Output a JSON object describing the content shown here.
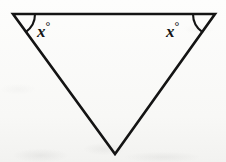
{
  "figure": {
    "background_color": "#fbfbfa",
    "stroke_color": "#141414",
    "stroke_width": 2.6,
    "shape": {
      "name": "triangle",
      "orientation": "point-down",
      "vertices": [
        {
          "name": "top-left",
          "x": 13,
          "y": 14
        },
        {
          "name": "top-right",
          "x": 215,
          "y": 14
        },
        {
          "name": "bottom-apex",
          "x": 115,
          "y": 154
        }
      ]
    },
    "angle_marks": [
      {
        "name": "left-angle-arc",
        "vertex": "top-left",
        "label": "x",
        "degree_symbol": "°",
        "label_position": {
          "x": 37,
          "y": 20
        },
        "arc_radius": 22
      },
      {
        "name": "right-angle-arc",
        "vertex": "top-right",
        "label": "x",
        "degree_symbol": "°",
        "label_position": {
          "x": 166,
          "y": 20
        },
        "arc_radius": 22
      }
    ]
  },
  "labels": {
    "left_angle_value": "x",
    "left_angle_degree": "°",
    "right_angle_value": "x",
    "right_angle_degree": "°"
  }
}
